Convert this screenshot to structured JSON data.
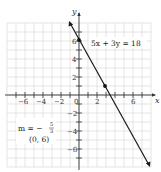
{
  "chart_data": {
    "type": "line",
    "title": "",
    "xlabel": "x",
    "ylabel": "y",
    "xlim": [
      -8,
      8
    ],
    "ylim": [
      -8,
      8
    ],
    "grid": true,
    "x_ticks": [
      -6,
      -4,
      -2,
      0,
      2,
      6
    ],
    "x_tick_labels": [
      "−6",
      "−4",
      "−2",
      "0",
      "2",
      "6"
    ],
    "y_ticks": [
      6,
      4,
      2,
      -2,
      -4,
      -6
    ],
    "y_tick_labels": [
      "6",
      "4",
      "2",
      "−2",
      "−4",
      "−6"
    ],
    "series": [
      {
        "name": "5x + 3y = 18",
        "equation": "5x + 3y = 18",
        "slope": "-5/3",
        "y_intercept": 6,
        "x": [
          -1.2,
          8.0
        ],
        "y": [
          8.0,
          -7.33
        ],
        "marked_points": [
          {
            "x": 0,
            "y": 6
          },
          {
            "x": 3,
            "y": 1
          }
        ]
      }
    ],
    "annotations": [
      {
        "text": "5x + 3y = 18",
        "x": 2.0,
        "y": 5.3
      },
      {
        "text": "m = −5/3",
        "x": -6.2,
        "y": -3.5
      },
      {
        "text": "(0, 6)",
        "x": -5.4,
        "y": -5.2
      }
    ]
  },
  "labels": {
    "x_axis": "x",
    "y_axis": "y",
    "equation": "5x + 3y = 18",
    "slope_prefix": "m = −",
    "slope_num": "5",
    "slope_den": "3",
    "point": "(0, 6)",
    "ticks": {
      "xm6": "−6",
      "xm4": "−4",
      "xm2": "−2",
      "x0": "0",
      "x2": "2",
      "x6": "6",
      "y6": "6",
      "y4": "4",
      "y2": "2",
      "ym2": "−2",
      "ym4": "−4",
      "ym6": "−6"
    }
  }
}
